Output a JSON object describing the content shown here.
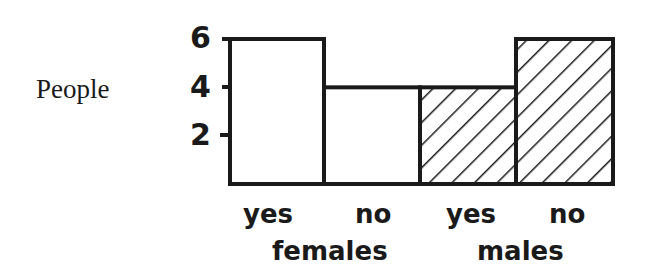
{
  "chart_data": {
    "type": "bar",
    "title": "",
    "xlabel": "",
    "ylabel": "People",
    "ylim": [
      0,
      6
    ],
    "yticks": [
      2,
      4,
      6
    ],
    "categories": [
      "yes",
      "no",
      "yes",
      "no"
    ],
    "groups": [
      {
        "name": "females",
        "categories": [
          "yes",
          "no"
        ],
        "values": [
          6,
          4
        ],
        "fill": "white"
      },
      {
        "name": "males",
        "categories": [
          "yes",
          "no"
        ],
        "values": [
          4,
          6
        ],
        "fill": "diagonal-hatch"
      }
    ],
    "values": [
      6,
      4,
      4,
      6
    ],
    "grid": false,
    "legend": "none"
  },
  "labels": {
    "ylabel": "People",
    "ticks": [
      "6",
      "4",
      "2"
    ],
    "cats": [
      "yes",
      "no",
      "yes",
      "no"
    ],
    "groups": [
      "females",
      "males"
    ]
  },
  "colors": {
    "ink": "#1a1a1a",
    "background": "#ffffff"
  }
}
